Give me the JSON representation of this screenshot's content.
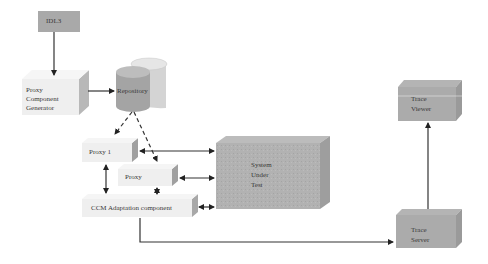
{
  "diagram": {
    "nodes": {
      "idl3": {
        "label": "IDL3"
      },
      "generator": {
        "line1": "Proxy",
        "line2": "Component",
        "line3": "Generator"
      },
      "repository": {
        "label": "Repository"
      },
      "proxy1": {
        "label": "Proxy 1"
      },
      "proxy": {
        "label": "Proxy"
      },
      "ccm": {
        "label": "CCM Adaptation component"
      },
      "sut": {
        "line1": "System",
        "line2": "Under",
        "line3": "Test"
      },
      "trace_viewer": {
        "line1": "Trace",
        "line2": "Viewer"
      },
      "trace_server": {
        "line1": "Trace",
        "line2": "Server"
      }
    },
    "edges": [
      {
        "from": "IDL3",
        "to": "Proxy Component Generator",
        "style": "solid"
      },
      {
        "from": "Proxy Component Generator",
        "to": "Repository",
        "style": "solid"
      },
      {
        "from": "Repository",
        "to": "Proxy 1",
        "style": "dashed"
      },
      {
        "from": "Repository",
        "to": "Proxy",
        "style": "dashed"
      },
      {
        "from": "Proxy 1",
        "to": "System Under Test",
        "style": "bidirectional"
      },
      {
        "from": "Proxy",
        "to": "System Under Test",
        "style": "bidirectional"
      },
      {
        "from": "CCM Adaptation component",
        "to": "System Under Test",
        "style": "bidirectional"
      },
      {
        "from": "Proxy 1",
        "to": "CCM Adaptation component",
        "style": "bidirectional"
      },
      {
        "from": "Proxy",
        "to": "CCM Adaptation component",
        "style": "bidirectional"
      },
      {
        "from": "CCM Adaptation component",
        "to": "Trace Server",
        "style": "solid"
      },
      {
        "from": "Trace Server",
        "to": "Trace Viewer",
        "style": "solid"
      }
    ],
    "colors": {
      "dark_box": "#a8a8a8",
      "light_box": "#efefef",
      "side_dark": "#8c8c8c",
      "side_light": "#c8c8c8",
      "arrow": "#333333"
    }
  }
}
